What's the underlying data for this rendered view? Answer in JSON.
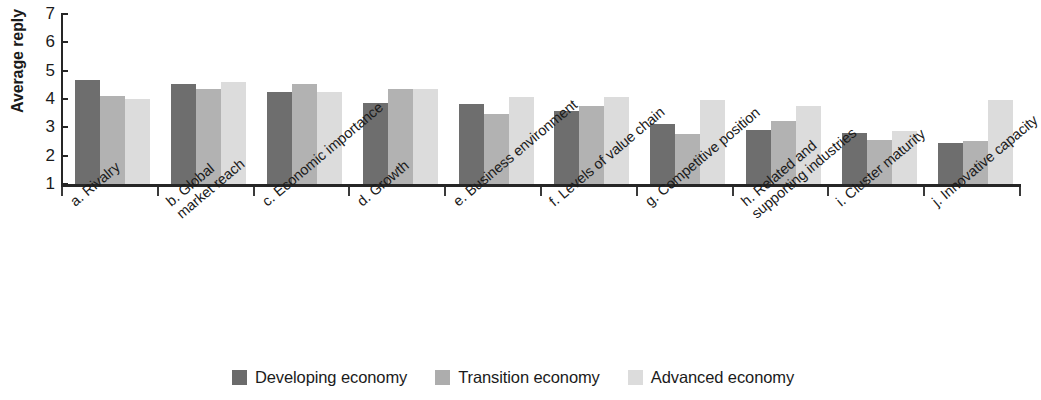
{
  "chart_data": {
    "type": "bar",
    "title": "",
    "xlabel": "",
    "ylabel": "Average reply",
    "ylim": [
      1,
      7
    ],
    "yticks": [
      1,
      2,
      3,
      4,
      5,
      6,
      7
    ],
    "grid": false,
    "legend_position": "bottom-center",
    "categories": [
      "a. Rivalry",
      "b. Global\nmarket reach",
      "c. Economic importance",
      "d. Growth",
      "e. Business environment",
      "f. Levels of value chain",
      "g. Competitive position",
      "h. Related and\nsupporting industries",
      "i. Cluster maturity",
      "j. Innovative capacity"
    ],
    "series": [
      {
        "name": "Developing economy",
        "color": "#6e6e6e",
        "values": [
          4.7,
          4.55,
          4.3,
          3.9,
          3.85,
          3.6,
          3.15,
          2.95,
          2.85,
          2.5
        ]
      },
      {
        "name": "Transition economy",
        "color": "#b2b2b2",
        "values": [
          4.15,
          4.4,
          4.55,
          4.4,
          3.5,
          3.8,
          2.8,
          3.25,
          2.6,
          2.55
        ]
      },
      {
        "name": "Advanced economy",
        "color": "#dcdcdc",
        "values": [
          4.05,
          4.65,
          4.3,
          4.4,
          4.1,
          4.1,
          4.0,
          3.8,
          2.9,
          4.0
        ]
      }
    ]
  },
  "axis": {
    "y_title": "Average reply"
  }
}
